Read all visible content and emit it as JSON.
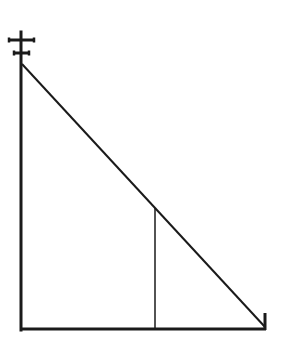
{
  "diagram": {
    "colors": {
      "stroke": "#1a1a1a",
      "background": "#ffffff"
    },
    "pole": {
      "x": 21,
      "y_top": 32,
      "y_bottom": 330,
      "width": 3
    },
    "crossbars": [
      {
        "y": 40,
        "x1": 9,
        "x2": 34
      },
      {
        "y": 53,
        "x1": 14,
        "x2": 29
      }
    ],
    "diagonal": {
      "x1": 22,
      "y1": 64,
      "x2": 265,
      "y2": 327
    },
    "inner_vertical": {
      "x": 155,
      "y1": 208,
      "y2": 330
    },
    "ground": {
      "y": 329,
      "x1": 20,
      "x2": 266
    },
    "right_tick": {
      "x": 265,
      "y1": 313,
      "y2": 330
    }
  }
}
